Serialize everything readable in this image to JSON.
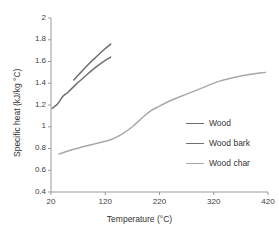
{
  "chart_data": {
    "type": "line",
    "title": "",
    "xlabel": "Temperature (°C)",
    "ylabel": "Specific heat (kJ/kg °C)",
    "xlim": [
      20,
      420
    ],
    "ylim": [
      0.4,
      2
    ],
    "xticks": [
      20,
      120,
      220,
      320,
      420
    ],
    "xtick_labels": [
      "20",
      "120",
      "220",
      "320",
      "420"
    ],
    "yticks": [
      0.4,
      0.6,
      0.8,
      1,
      1.2,
      1.4,
      1.6,
      1.8,
      2
    ],
    "ytick_labels": [
      "0.4",
      "0.6",
      "0.8",
      "1",
      "1.2",
      "1.4",
      "1.6",
      "1.8",
      "2"
    ],
    "grid": false,
    "legend_position": "center right",
    "series": [
      {
        "name": "Wood",
        "color": "#6e6e6e",
        "points": [
          {
            "x": 62,
            "y": 1.43
          },
          {
            "x": 75,
            "y": 1.5
          },
          {
            "x": 90,
            "y": 1.58
          },
          {
            "x": 105,
            "y": 1.65
          },
          {
            "x": 118,
            "y": 1.71
          },
          {
            "x": 130,
            "y": 1.76
          }
        ]
      },
      {
        "name": "Wood bark",
        "color": "#717171",
        "points": [
          {
            "x": 22,
            "y": 1.17
          },
          {
            "x": 32,
            "y": 1.21
          },
          {
            "x": 42,
            "y": 1.28
          },
          {
            "x": 52,
            "y": 1.32
          },
          {
            "x": 66,
            "y": 1.39
          },
          {
            "x": 82,
            "y": 1.46
          },
          {
            "x": 98,
            "y": 1.53
          },
          {
            "x": 114,
            "y": 1.59
          },
          {
            "x": 130,
            "y": 1.64
          }
        ]
      },
      {
        "name": "Wood char",
        "color": "#a8a8a8",
        "points": [
          {
            "x": 35,
            "y": 0.75
          },
          {
            "x": 60,
            "y": 0.79
          },
          {
            "x": 90,
            "y": 0.83
          },
          {
            "x": 115,
            "y": 0.86
          },
          {
            "x": 130,
            "y": 0.88
          },
          {
            "x": 150,
            "y": 0.93
          },
          {
            "x": 170,
            "y": 1.0
          },
          {
            "x": 190,
            "y": 1.09
          },
          {
            "x": 205,
            "y": 1.15
          },
          {
            "x": 220,
            "y": 1.19
          },
          {
            "x": 245,
            "y": 1.25
          },
          {
            "x": 270,
            "y": 1.3
          },
          {
            "x": 300,
            "y": 1.36
          },
          {
            "x": 325,
            "y": 1.41
          },
          {
            "x": 355,
            "y": 1.45
          },
          {
            "x": 385,
            "y": 1.48
          },
          {
            "x": 415,
            "y": 1.5
          }
        ]
      }
    ]
  },
  "legend": {
    "items": [
      {
        "label": "Wood",
        "color": "#6e6e6e"
      },
      {
        "label": "Wood bark",
        "color": "#717171"
      },
      {
        "label": "Wood char",
        "color": "#a8a8a8"
      }
    ]
  },
  "axes": {
    "line_color": "#9a9a9a"
  }
}
